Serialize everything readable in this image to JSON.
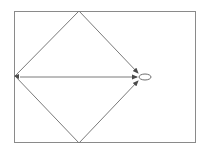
{
  "diagram": {
    "colors": {
      "background": "#ffffff",
      "stroke": "#6e6e6e",
      "frame": "#8a8a8a"
    },
    "frame": {
      "x": 14,
      "y": 11,
      "width": 182,
      "height": 132
    },
    "nodes": [
      {
        "id": "top",
        "x": 79,
        "y": 11
      },
      {
        "id": "bottom",
        "x": 79,
        "y": 143
      },
      {
        "id": "left",
        "x": 15,
        "y": 76
      },
      {
        "id": "target",
        "shape": "ellipse",
        "cx": 145,
        "cy": 77,
        "rx": 6,
        "ry": 3
      }
    ],
    "edges": [
      {
        "from": "top",
        "to": "left",
        "arrow": false
      },
      {
        "from": "left",
        "to": "bottom",
        "arrow": false
      },
      {
        "from": "top",
        "to": "target",
        "arrow": true
      },
      {
        "from": "bottom",
        "to": "target",
        "arrow": true
      },
      {
        "from": "left",
        "to": "target",
        "arrow": true
      }
    ]
  }
}
